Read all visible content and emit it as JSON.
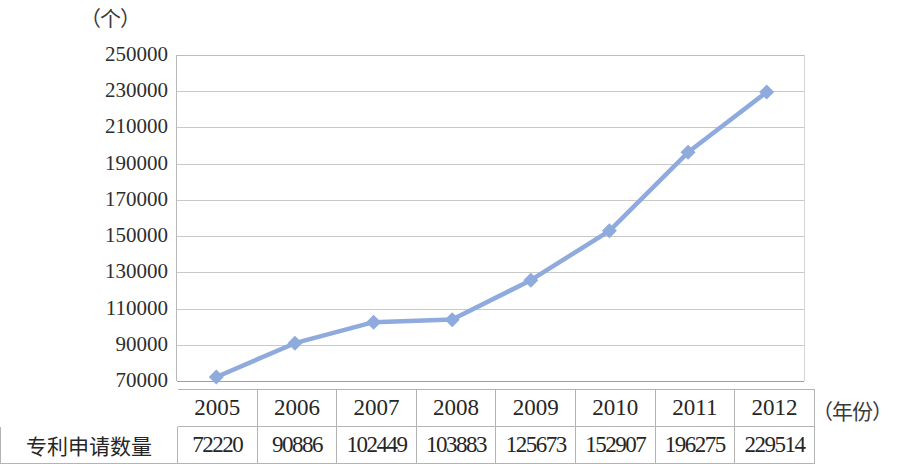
{
  "chart_data": {
    "type": "line",
    "title": "",
    "subtitle": "",
    "xlabel": "（年份）",
    "ylabel": "（个）",
    "categories": [
      "2005",
      "2006",
      "2007",
      "2008",
      "2009",
      "2010",
      "2011",
      "2012"
    ],
    "series": [
      {
        "name": "专利申请数量",
        "values": [
          72220,
          90886,
          102449,
          103883,
          125673,
          152907,
          196275,
          229514
        ],
        "color": "#8FAADC",
        "marker": "diamond"
      }
    ],
    "ylim": [
      70000,
      250000
    ],
    "ytick_step": 20000,
    "yticks": [
      "250000",
      "230000",
      "210000",
      "190000",
      "170000",
      "150000",
      "130000",
      "110000",
      "90000",
      "70000"
    ],
    "grid": "horizontal",
    "legend": "none"
  },
  "table": {
    "row_label": "专利申请数量",
    "header_blank": "",
    "years": [
      "2005",
      "2006",
      "2007",
      "2008",
      "2009",
      "2010",
      "2011",
      "2012"
    ],
    "values": [
      "72220",
      "90886",
      "102449",
      "103883",
      "125673",
      "152907",
      "196275",
      "229514"
    ]
  }
}
